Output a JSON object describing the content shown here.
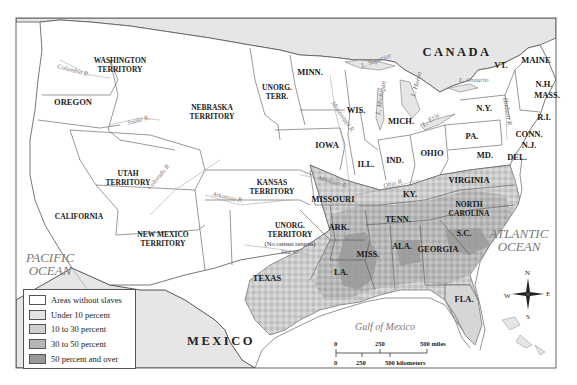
{
  "map": {
    "countries": [
      {
        "name": "CANADA",
        "x": 457,
        "y": 56
      },
      {
        "name": "MEXICO",
        "x": 221,
        "y": 345
      }
    ],
    "oceans": [
      {
        "line1": "PACIFIC",
        "line2": "OCEAN",
        "x": 50,
        "y": 262
      },
      {
        "line1": "ATLANTIC",
        "line2": "OCEAN",
        "x": 519,
        "y": 238
      }
    ],
    "gulf": {
      "label": "Gulf of Mexico",
      "x": 385,
      "y": 330
    },
    "regions": [
      {
        "id": "washington-territory",
        "lines": [
          "WASHINGTON",
          "TERRITORY"
        ],
        "x": 120,
        "y": 63
      },
      {
        "id": "oregon",
        "lines": [
          "OREGON"
        ],
        "x": 73,
        "y": 105
      },
      {
        "id": "nebraska-territory",
        "lines": [
          "NEBRASKA",
          "TERRITORY"
        ],
        "x": 212,
        "y": 110
      },
      {
        "id": "unorg-terr-north",
        "lines": [
          "UNORG.",
          "TERR."
        ],
        "x": 277,
        "y": 90
      },
      {
        "id": "minn",
        "lines": [
          "MINN."
        ],
        "x": 310,
        "y": 75
      },
      {
        "id": "wis",
        "lines": [
          "WIS."
        ],
        "x": 356,
        "y": 113
      },
      {
        "id": "mich",
        "lines": [
          "MICH."
        ],
        "x": 401,
        "y": 124
      },
      {
        "id": "iowa",
        "lines": [
          "IOWA"
        ],
        "x": 327,
        "y": 148
      },
      {
        "id": "ill",
        "lines": [
          "ILL."
        ],
        "x": 366,
        "y": 167
      },
      {
        "id": "ind",
        "lines": [
          "IND."
        ],
        "x": 395,
        "y": 163
      },
      {
        "id": "ohio",
        "lines": [
          "OHIO"
        ],
        "x": 432,
        "y": 156
      },
      {
        "id": "pa",
        "lines": [
          "PA."
        ],
        "x": 472,
        "y": 139
      },
      {
        "id": "ny",
        "lines": [
          "N.Y."
        ],
        "x": 484,
        "y": 111
      },
      {
        "id": "vt",
        "lines": [
          "VT."
        ],
        "x": 501,
        "y": 68
      },
      {
        "id": "maine",
        "lines": [
          "MAINE"
        ],
        "x": 536,
        "y": 63
      },
      {
        "id": "nh",
        "lines": [
          "N.H."
        ],
        "x": 544,
        "y": 87
      },
      {
        "id": "mass",
        "lines": [
          "MASS."
        ],
        "x": 547,
        "y": 98
      },
      {
        "id": "ri",
        "lines": [
          "R.I."
        ],
        "x": 544,
        "y": 120
      },
      {
        "id": "conn",
        "lines": [
          "CONN."
        ],
        "x": 529,
        "y": 137
      },
      {
        "id": "nj",
        "lines": [
          "N.J."
        ],
        "x": 529,
        "y": 148
      },
      {
        "id": "md",
        "lines": [
          "MD."
        ],
        "x": 485,
        "y": 158
      },
      {
        "id": "del",
        "lines": [
          "DEL."
        ],
        "x": 517,
        "y": 160
      },
      {
        "id": "virginia",
        "lines": [
          "VIRGINIA"
        ],
        "x": 469,
        "y": 183
      },
      {
        "id": "ky",
        "lines": [
          "KY."
        ],
        "x": 410,
        "y": 197
      },
      {
        "id": "north-carolina",
        "lines": [
          "NORTH",
          "CAROLINA"
        ],
        "x": 469,
        "y": 207
      },
      {
        "id": "tenn",
        "lines": [
          "TENN."
        ],
        "x": 398,
        "y": 222
      },
      {
        "id": "sc",
        "lines": [
          "S.C."
        ],
        "x": 464,
        "y": 236
      },
      {
        "id": "georgia",
        "lines": [
          "GEORGIA"
        ],
        "x": 438,
        "y": 252
      },
      {
        "id": "ala",
        "lines": [
          "ALA."
        ],
        "x": 402,
        "y": 249
      },
      {
        "id": "miss",
        "lines": [
          "MISS."
        ],
        "x": 368,
        "y": 257
      },
      {
        "id": "la",
        "lines": [
          "LA."
        ],
        "x": 341,
        "y": 275
      },
      {
        "id": "ark",
        "lines": [
          "ARK."
        ],
        "x": 339,
        "y": 230
      },
      {
        "id": "missouri",
        "lines": [
          "MISSOURI"
        ],
        "x": 333,
        "y": 202
      },
      {
        "id": "fla",
        "lines": [
          "FLA."
        ],
        "x": 464,
        "y": 302
      },
      {
        "id": "kansas-territory",
        "lines": [
          "KANSAS",
          "TERRITORY"
        ],
        "x": 272,
        "y": 185
      },
      {
        "id": "utah-territory",
        "lines": [
          "UTAH",
          "TERRITORY"
        ],
        "x": 128,
        "y": 176
      },
      {
        "id": "california",
        "lines": [
          "CALIFORNIA"
        ],
        "x": 79,
        "y": 219
      },
      {
        "id": "new-mexico-territory",
        "lines": [
          "NEW MEXICO",
          "TERRITORY"
        ],
        "x": 163,
        "y": 237
      },
      {
        "id": "unorg-territory-south",
        "lines": [
          "UNORG.",
          "TERRITORY"
        ],
        "x": 290,
        "y": 228
      },
      {
        "id": "texas",
        "lines": [
          "TEXAS"
        ],
        "x": 267,
        "y": 281
      }
    ],
    "notes": [
      {
        "text": "(No census returns)",
        "x": 290,
        "y": 246
      }
    ],
    "rivers": [
      {
        "name": "Columbia R.",
        "x": 57,
        "y": 68,
        "rot": 15
      },
      {
        "name": "Snake R.",
        "x": 128,
        "y": 125,
        "rot": -15
      },
      {
        "name": "Colorado R.",
        "x": 150,
        "y": 190,
        "rot": -50
      },
      {
        "name": "Arkansas R.",
        "x": 212,
        "y": 196,
        "rot": 12
      },
      {
        "name": "Missouri R.",
        "x": 318,
        "y": 180,
        "rot": 15
      },
      {
        "name": "Mississippi R.",
        "x": 331,
        "y": 103,
        "rot": 55
      },
      {
        "name": "Ohio R.",
        "x": 384,
        "y": 188,
        "rot": -15
      },
      {
        "name": "Red R.",
        "x": 281,
        "y": 254,
        "rot": 0
      }
    ],
    "lakes": [
      {
        "name": "L. Superior",
        "x": 362,
        "y": 68,
        "rot": -20
      },
      {
        "name": "L. Michigan",
        "x": 380,
        "y": 115,
        "rot": -80
      },
      {
        "name": "L. Huron",
        "x": 415,
        "y": 97,
        "rot": -75
      },
      {
        "name": "L. Erie",
        "x": 424,
        "y": 127,
        "rot": -35
      },
      {
        "name": "L. Ontario",
        "x": 459,
        "y": 82,
        "rot": 0
      },
      {
        "name": "Hudson R.",
        "x": 503,
        "y": 98,
        "rot": 80
      }
    ]
  },
  "legend": {
    "items": [
      {
        "label": "Areas without slaves",
        "color": "#ffffff"
      },
      {
        "label": "Under 10 percent",
        "color": "#e4e4e4"
      },
      {
        "label": "10 to 30 percent",
        "color": "#cfcfcf"
      },
      {
        "label": "30 to 50 percent",
        "color": "#b5b5b5"
      },
      {
        "label": "50 percent and over",
        "color": "#999999"
      }
    ]
  },
  "scale_bar": {
    "miles_labels": [
      "0",
      "250",
      "500 miles"
    ],
    "km_labels": [
      "0",
      "250",
      "500 kilometers"
    ]
  },
  "compass": {
    "n": "N",
    "s": "S",
    "e": "E",
    "w": "W"
  },
  "colors": {
    "land_free": "#ffffff",
    "foreign_land": "#e9e9e9",
    "shade_low": "#e4e4e4",
    "shade_mid": "#cfcfcf",
    "shade_high": "#b5b5b5",
    "shade_max": "#999999",
    "border": "#555555",
    "ocean_text": "#7a7a7a"
  }
}
